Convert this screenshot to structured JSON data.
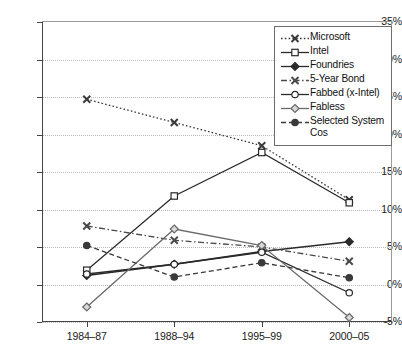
{
  "chart_data": {
    "type": "line",
    "title": "",
    "subtitle": "",
    "xlabel": "",
    "ylabel": "",
    "categories": [
      "1984–87",
      "1988–94",
      "1995–99",
      "2000–05"
    ],
    "ylim": [
      -5,
      35
    ],
    "ytick_labels": [
      "35%",
      "30%",
      "25%",
      "20%",
      "15%",
      "10%",
      "5%",
      "0%",
      "-5%"
    ],
    "ytick_values": [
      35,
      30,
      25,
      20,
      15,
      10,
      5,
      0,
      -5
    ],
    "grid": true,
    "grid_style": "dotted-horizontal",
    "legend_position": "top-right",
    "value_unit": "percent",
    "series": [
      {
        "name": "Microsoft",
        "values": [
          24.7,
          21.6,
          18.5,
          11.3
        ],
        "line_style": "dotted",
        "marker": "cross",
        "marker_fill": "filled",
        "color": "#3a3a3a"
      },
      {
        "name": "Intel",
        "values": [
          1.9,
          11.8,
          17.6,
          10.9
        ],
        "line_style": "solid",
        "marker": "square",
        "marker_fill": "open",
        "color": "#2a2a2a"
      },
      {
        "name": "Foundries",
        "values": [
          1.2,
          2.7,
          4.4,
          5.7
        ],
        "line_style": "solid",
        "marker": "diamond",
        "marker_fill": "filled",
        "color": "#2a2a2a"
      },
      {
        "name": "5-Year Bond",
        "values": [
          7.8,
          5.9,
          5.0,
          3.1
        ],
        "line_style": "dashdot",
        "marker": "cross",
        "marker_fill": "filled",
        "color": "#4a4a4a"
      },
      {
        "name": "Fabbed (x-Intel)",
        "values": [
          1.4,
          2.7,
          4.3,
          -1.1
        ],
        "line_style": "solid",
        "marker": "circle",
        "marker_fill": "open",
        "color": "#2a2a2a"
      },
      {
        "name": "Fabless",
        "values": [
          -3.0,
          7.4,
          5.2,
          -4.4
        ],
        "line_style": "solid",
        "marker": "diamond",
        "marker_fill": "open",
        "color": "#6a6a6a"
      },
      {
        "name": "Selected System Cos",
        "values": [
          5.2,
          1.0,
          2.9,
          0.9
        ],
        "line_style": "dashed",
        "marker": "circle",
        "marker_fill": "filled",
        "color": "#3a3a3a"
      }
    ]
  },
  "legend": {
    "entries": [
      {
        "label": "Microsoft"
      },
      {
        "label": "Intel"
      },
      {
        "label": "Foundries"
      },
      {
        "label": "5-Year Bond"
      },
      {
        "label": "Fabbed (x-Intel)"
      },
      {
        "label": "Fabless"
      },
      {
        "label": "Selected System\nCos"
      }
    ]
  }
}
